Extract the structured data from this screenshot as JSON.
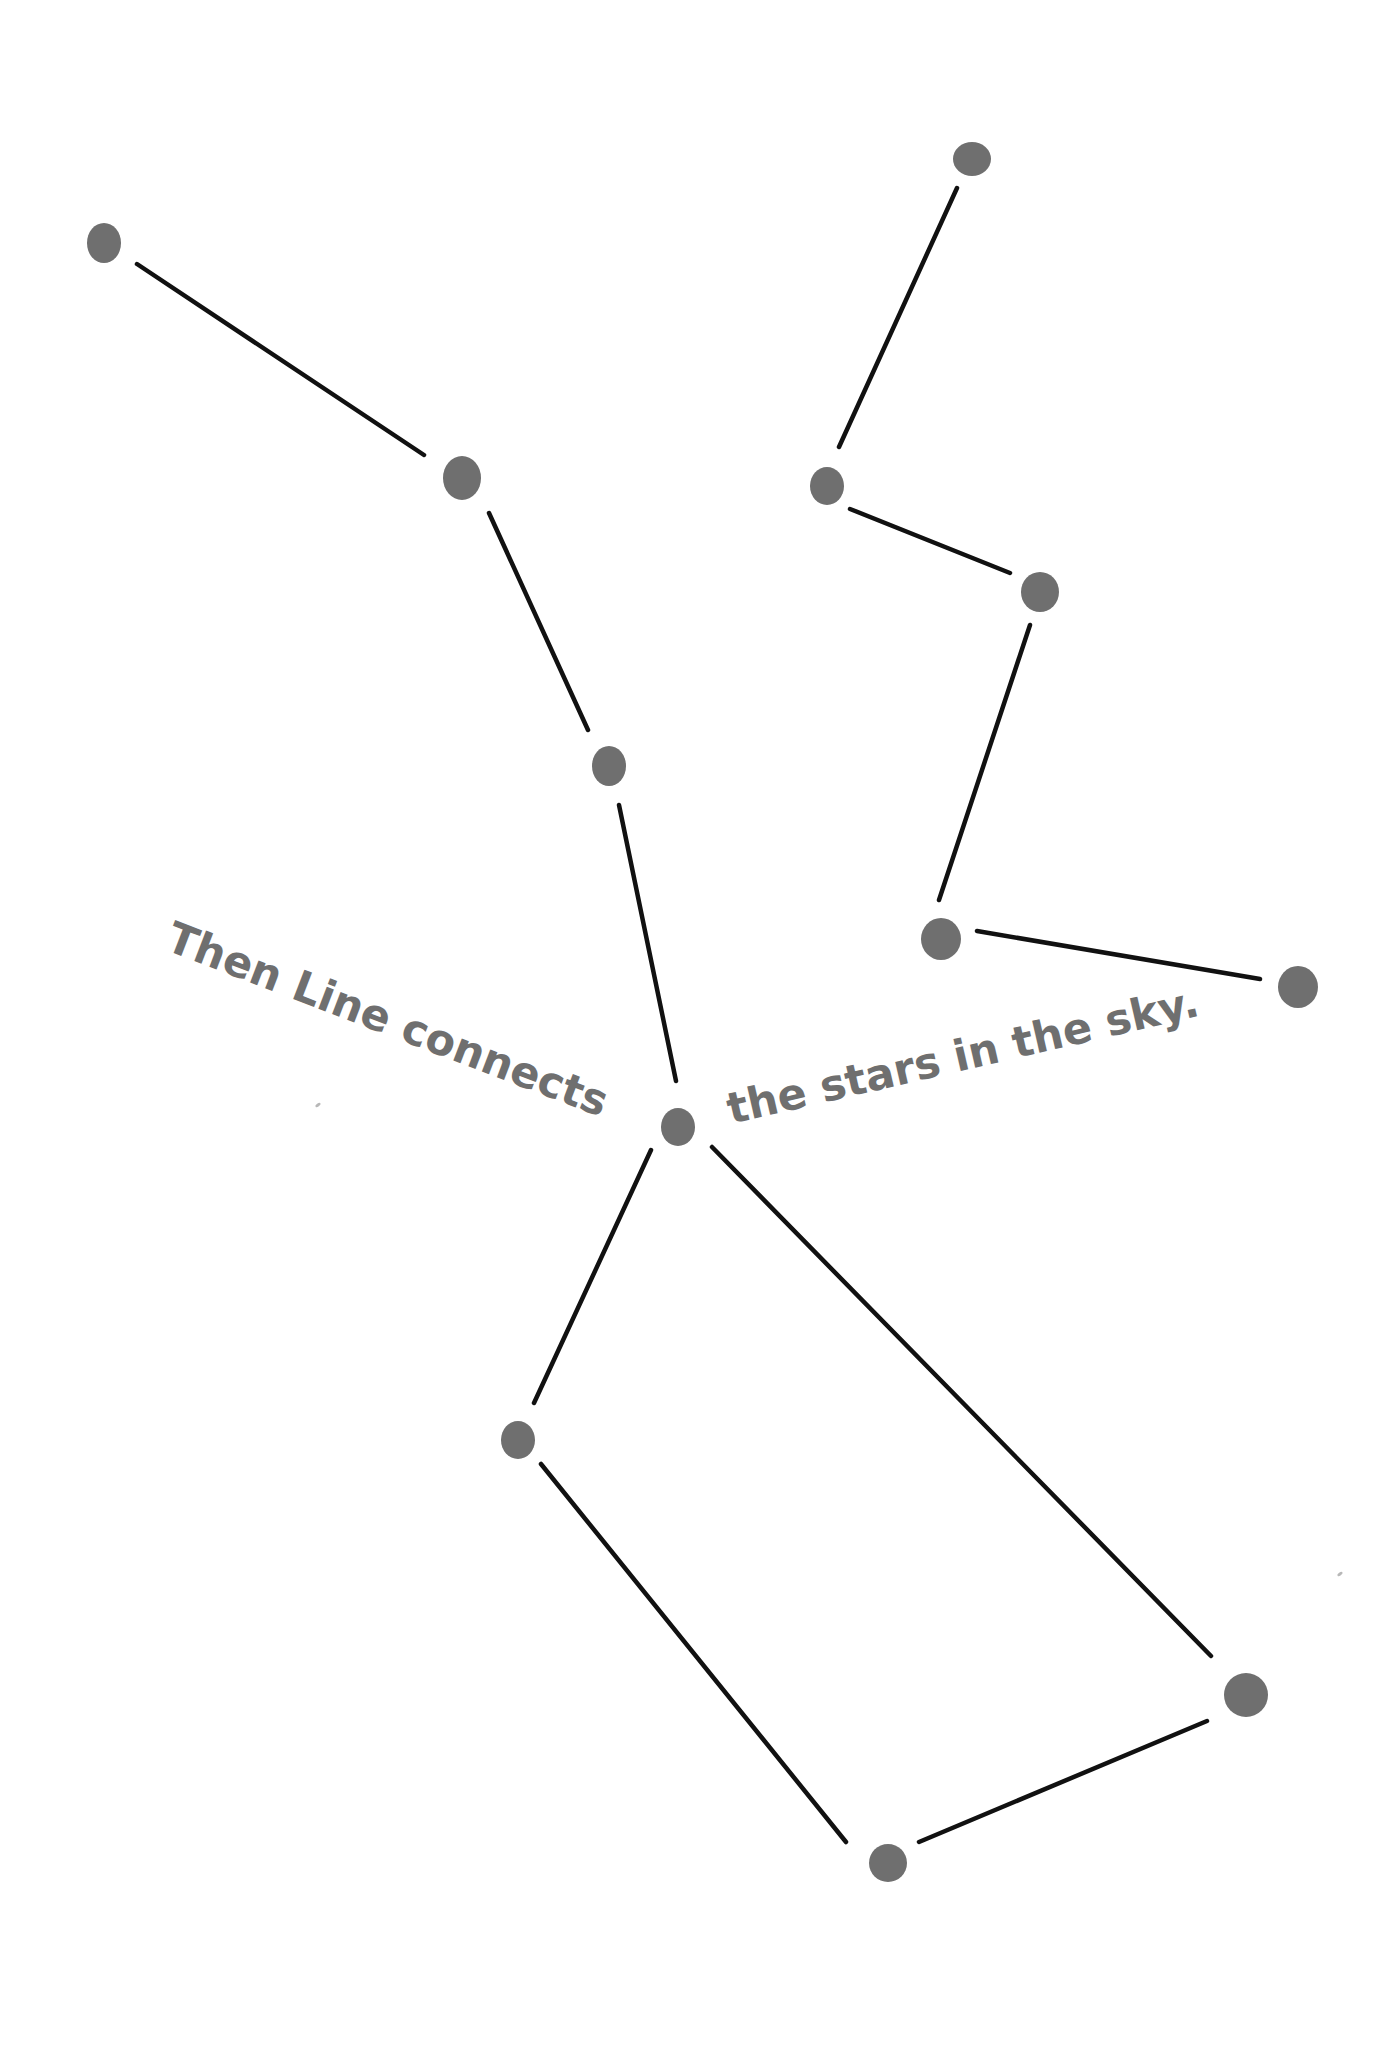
{
  "page": {
    "background": "#ffffff",
    "star_color": "#6f6f6f",
    "line_color": "#111111",
    "text_color": "#6f6f6f"
  },
  "captions": [
    {
      "id": "caption-left",
      "text": "Then Line connects",
      "x": 178,
      "y": 912,
      "rotate_deg": 21,
      "font_size": 43
    },
    {
      "id": "caption-right",
      "text": "the stars in the sky.",
      "x": 722,
      "y": 1085,
      "rotate_deg": -13,
      "font_size": 43
    }
  ],
  "stars": [
    {
      "id": "star-1",
      "x": 104,
      "y": 243,
      "rx": 17,
      "ry": 20
    },
    {
      "id": "star-2",
      "x": 462,
      "y": 478,
      "rx": 19,
      "ry": 22
    },
    {
      "id": "star-3",
      "x": 609,
      "y": 766,
      "rx": 17,
      "ry": 20
    },
    {
      "id": "star-4",
      "x": 678,
      "y": 1127,
      "rx": 17,
      "ry": 19
    },
    {
      "id": "star-5",
      "x": 518,
      "y": 1440,
      "rx": 17,
      "ry": 19
    },
    {
      "id": "star-6",
      "x": 888,
      "y": 1863,
      "rx": 19,
      "ry": 19
    },
    {
      "id": "star-7",
      "x": 1246,
      "y": 1695,
      "rx": 22,
      "ry": 22
    },
    {
      "id": "star-8",
      "x": 972,
      "y": 159,
      "rx": 19,
      "ry": 17
    },
    {
      "id": "star-9",
      "x": 827,
      "y": 486,
      "rx": 17,
      "ry": 19
    },
    {
      "id": "star-10",
      "x": 1040,
      "y": 592,
      "rx": 19,
      "ry": 20
    },
    {
      "id": "star-11",
      "x": 941,
      "y": 939,
      "rx": 20,
      "ry": 21
    },
    {
      "id": "star-12",
      "x": 1298,
      "y": 987,
      "rx": 20,
      "ry": 21
    }
  ],
  "lines": [
    {
      "id": "line-1-2",
      "x1": 137,
      "y1": 264,
      "x2": 424,
      "y2": 455
    },
    {
      "id": "line-2-3",
      "x1": 489,
      "y1": 513,
      "x2": 588,
      "y2": 730
    },
    {
      "id": "line-3-4",
      "x1": 619,
      "y1": 805,
      "x2": 676,
      "y2": 1081
    },
    {
      "id": "line-4-5",
      "x1": 651,
      "y1": 1150,
      "x2": 534,
      "y2": 1403
    },
    {
      "id": "line-5-6",
      "x1": 541,
      "y1": 1464,
      "x2": 846,
      "y2": 1842
    },
    {
      "id": "line-6-7",
      "x1": 919,
      "y1": 1842,
      "x2": 1207,
      "y2": 1721
    },
    {
      "id": "line-4-7",
      "x1": 712,
      "y1": 1147,
      "x2": 1211,
      "y2": 1656
    },
    {
      "id": "line-8-9",
      "x1": 957,
      "y1": 188,
      "x2": 839,
      "y2": 447
    },
    {
      "id": "line-9-10",
      "x1": 850,
      "y1": 509,
      "x2": 1010,
      "y2": 573
    },
    {
      "id": "line-10-11",
      "x1": 1030,
      "y1": 625,
      "x2": 939,
      "y2": 900
    },
    {
      "id": "line-11-12",
      "x1": 977,
      "y1": 931,
      "x2": 1260,
      "y2": 979
    }
  ],
  "specks": [
    {
      "id": "speck-left",
      "x": 318,
      "y": 1105
    },
    {
      "id": "speck-right",
      "x": 1340,
      "y": 1574
    }
  ]
}
